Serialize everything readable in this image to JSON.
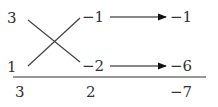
{
  "diagram": {
    "left_column": [
      "3",
      "1"
    ],
    "right_column": [
      "−1",
      "−2"
    ],
    "products": [
      "−1",
      "−6"
    ],
    "sums": {
      "left": "3",
      "middle": "2",
      "right": "−7"
    }
  }
}
